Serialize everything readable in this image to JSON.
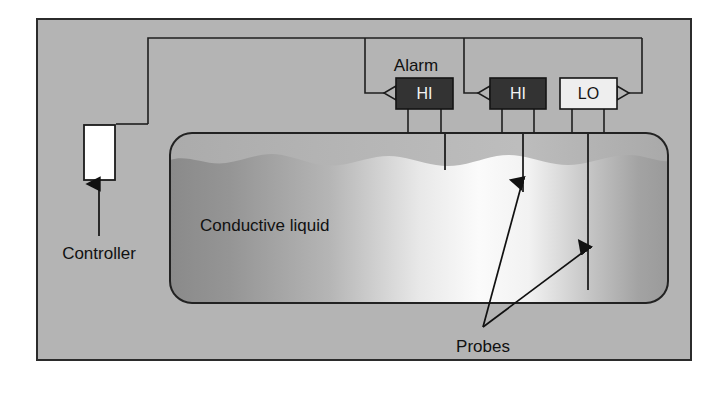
{
  "figure": {
    "panel": {
      "background_color": "#b4b4b4",
      "border_color": "#2b2b2b",
      "outer_margin_color": "#ffffff"
    },
    "wire_color": "#1f1f1f"
  },
  "labels": {
    "controller": "Controller",
    "alarm": "Alarm",
    "probes": "Probes",
    "liquid": "Conductive liquid"
  },
  "modules": [
    {
      "id": "alarm-hi-1",
      "label": "HI",
      "fill_color": "#333333",
      "text_color": "#f2f2f2",
      "pointer_side": "left",
      "x": 396,
      "y": 78,
      "width": 57,
      "height": 31
    },
    {
      "id": "alarm-hi-2",
      "label": "HI",
      "fill_color": "#333333",
      "text_color": "#f2f2f2",
      "pointer_side": "left",
      "x": 490,
      "y": 78,
      "width": 56,
      "height": 31
    },
    {
      "id": "alarm-lo",
      "label": "LO",
      "fill_color": "#eeeeee",
      "text_color": "#151515",
      "pointer_side": "right",
      "x": 560,
      "y": 78,
      "width": 57,
      "height": 31
    }
  ],
  "controller": {
    "label": "Controller",
    "fill_color": "#ffffff",
    "x": 84,
    "y": 125,
    "width": 31,
    "height": 55
  },
  "tank": {
    "x": 170,
    "y": 133,
    "width": 498,
    "height": 170,
    "corner_radius": 22,
    "border_color": "#222222",
    "liquid_top": 157,
    "liquid_label": "Conductive liquid",
    "liquid_gradient_stops": [
      "#8e8e8e",
      "#a6a6a6",
      "#f4f4f4",
      "#fbfbfb",
      "#d0d0d0",
      "#a0a0a0"
    ]
  },
  "probes": {
    "label": "Probes",
    "items": [
      {
        "id": "probe-hi-short",
        "x": 445,
        "top": 133,
        "bottom": 170,
        "note": "short HI reference probe"
      },
      {
        "id": "probe-hi-level",
        "x": 523,
        "top": 133,
        "bottom": 192,
        "note": "HI level probe"
      },
      {
        "id": "probe-lo-level",
        "x": 588,
        "top": 133,
        "bottom": 290,
        "note": "LO level probe"
      }
    ]
  }
}
